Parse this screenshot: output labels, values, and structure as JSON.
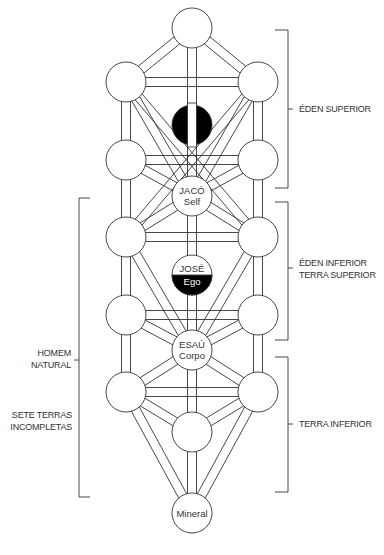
{
  "diagram": {
    "type": "tree-of-life",
    "colors": {
      "stroke": "#333333",
      "fill": "#ffffff",
      "dark": "#000000"
    },
    "nodes": [
      {
        "id": "top",
        "x": 192,
        "y": 28,
        "label1": "",
        "label2": ""
      },
      {
        "id": "ul",
        "x": 126,
        "y": 82,
        "label1": "",
        "label2": ""
      },
      {
        "id": "ur",
        "x": 258,
        "y": 82,
        "label1": "",
        "label2": ""
      },
      {
        "id": "ml",
        "x": 126,
        "y": 160,
        "label1": "",
        "label2": ""
      },
      {
        "id": "mr",
        "x": 258,
        "y": 160,
        "label1": "",
        "label2": ""
      },
      {
        "id": "jaco",
        "x": 192,
        "y": 196,
        "label1": "JACÓ",
        "label2": "Self"
      },
      {
        "id": "l3",
        "x": 126,
        "y": 237,
        "label1": "",
        "label2": ""
      },
      {
        "id": "r3",
        "x": 258,
        "y": 237,
        "label1": "",
        "label2": ""
      },
      {
        "id": "l4",
        "x": 126,
        "y": 315,
        "label1": "",
        "label2": ""
      },
      {
        "id": "r4",
        "x": 258,
        "y": 315,
        "label1": "",
        "label2": ""
      },
      {
        "id": "esau",
        "x": 192,
        "y": 350,
        "label1": "ESAÚ",
        "label2": "Corpo"
      },
      {
        "id": "l5",
        "x": 126,
        "y": 392,
        "label1": "",
        "label2": ""
      },
      {
        "id": "r5",
        "x": 258,
        "y": 392,
        "label1": "",
        "label2": ""
      },
      {
        "id": "bm",
        "x": 192,
        "y": 432,
        "label1": "",
        "label2": ""
      },
      {
        "id": "mineral",
        "x": 192,
        "y": 513,
        "label1": "Mineral",
        "label2": ""
      }
    ],
    "dark_node": {
      "x": 192,
      "y": 125,
      "label": ""
    },
    "half_node": {
      "x": 192,
      "y": 275,
      "label_top": "JOSÉ",
      "label_bottom": "Ego"
    },
    "labels": {
      "eden_superior": "ÉDEN SUPERIOR",
      "eden_inferior": "ÉDEN INFERIOR",
      "terra_superior": "TERRA SUPERIOR",
      "terra_inferior": "TERRA INFERIOR",
      "homem": "HOMEM",
      "natural": "NATURAL",
      "sete_terras": "SETE TERRAS",
      "incompletas": "INCOMPLETAS"
    }
  }
}
